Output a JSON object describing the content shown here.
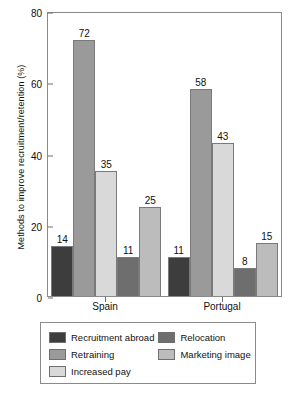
{
  "chart_data": {
    "type": "bar",
    "title": "",
    "xlabel": "",
    "ylabel": "Methods to improve recruitment/retention (%)",
    "ylim": [
      0,
      80
    ],
    "yticks": [
      0,
      20,
      40,
      60,
      80
    ],
    "grid": false,
    "legend_position": "bottom",
    "categories": [
      "Spain",
      "Portugal"
    ],
    "series": [
      {
        "name": "Recruitment abroad",
        "color": "#3d3d3d",
        "values": [
          14,
          11
        ]
      },
      {
        "name": "Retraining",
        "color": "#9a9a9a",
        "values": [
          72,
          58
        ]
      },
      {
        "name": "Increased pay",
        "color": "#d9d9d9",
        "values": [
          35,
          43
        ]
      },
      {
        "name": "Relocation",
        "color": "#6e6e6e",
        "values": [
          11,
          8
        ]
      },
      {
        "name": "Marketing image",
        "color": "#bcbcbc",
        "values": [
          25,
          15
        ]
      }
    ],
    "legend_order": [
      "Recruitment abroad",
      "Relocation",
      "Retraining",
      "Marketing image",
      "Increased pay"
    ]
  }
}
